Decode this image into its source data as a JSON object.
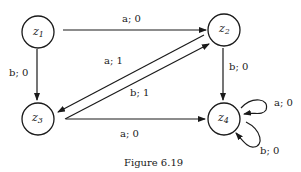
{
  "diagram": {
    "type": "state-transition-diagram",
    "nodes": [
      {
        "id": "z1",
        "label": "z",
        "sub": "1",
        "x": 38,
        "y": 32
      },
      {
        "id": "z2",
        "label": "z",
        "sub": "2",
        "x": 224,
        "y": 30
      },
      {
        "id": "z3",
        "label": "z",
        "sub": "3",
        "x": 38,
        "y": 119
      },
      {
        "id": "z4",
        "label": "z",
        "sub": "4",
        "x": 224,
        "y": 119
      }
    ],
    "edges": [
      {
        "from": "z1",
        "to": "z2",
        "label": "a; 0"
      },
      {
        "from": "z1",
        "to": "z3",
        "label": "b; 0"
      },
      {
        "from": "z2",
        "to": "z3",
        "label": "a; 1"
      },
      {
        "from": "z3",
        "to": "z2",
        "label": "b; 1"
      },
      {
        "from": "z2",
        "to": "z4",
        "label": "b; 0"
      },
      {
        "from": "z3",
        "to": "z4",
        "label": "a; 0"
      },
      {
        "from": "z4",
        "to": "z4",
        "label": "a; 0"
      },
      {
        "from": "z4",
        "to": "z4",
        "label": "b; 0"
      }
    ],
    "caption": "Figure 6.19"
  }
}
